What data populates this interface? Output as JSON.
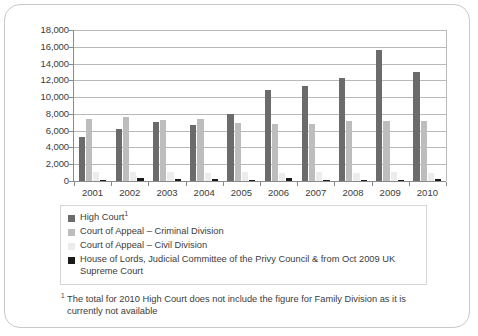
{
  "chart_data": {
    "type": "bar",
    "title": "",
    "subtitle": "",
    "xlabel": "",
    "ylabel": "",
    "ylim": [
      0,
      18000
    ],
    "ytick_step": 2000,
    "ytick_labels": [
      "18,000",
      "16,000",
      "14,000",
      "12,000",
      "10,000",
      "8,000",
      "6,000",
      "4,000",
      "2,000",
      "0"
    ],
    "grid": true,
    "legend_position": "below-chart",
    "categories": [
      "2001",
      "2002",
      "2003",
      "2004",
      "2005",
      "2006",
      "2007",
      "2008",
      "2009",
      "2010"
    ],
    "series": [
      {
        "name": "High Court",
        "color": "#6b6b6b",
        "values": [
          5300,
          6150,
          7000,
          6700,
          7950,
          10850,
          11350,
          12300,
          15650,
          12950
        ]
      },
      {
        "name": "Court of Appeal – Criminal Division",
        "color": "#bdbdbd",
        "values": [
          7350,
          7650,
          7300,
          7450,
          6900,
          6800,
          6800,
          7100,
          7100,
          7150
        ]
      },
      {
        "name": "Court of Appeal – Civil Division",
        "color": "#ececec",
        "values": [
          1050,
          1100,
          1100,
          1000,
          1100,
          950,
          1050,
          950,
          1100,
          1000
        ]
      },
      {
        "name": "House of Lords, Judicial Committee of the Privy Council & from Oct 2009 UK Supreme Court",
        "color": "#1a1a1a",
        "values": [
          150,
          330,
          200,
          210,
          180,
          300,
          170,
          120,
          170,
          250
        ]
      }
    ]
  },
  "legend": {
    "items": [
      {
        "label": "High Court",
        "superscript": "1",
        "color": "#6b6b6b",
        "swatch_name": "legend-swatch-high-court"
      },
      {
        "label": "Court of Appeal – Criminal Division",
        "superscript": "",
        "color": "#bdbdbd",
        "swatch_name": "legend-swatch-coa-criminal"
      },
      {
        "label": "Court of Appeal – Civil Division",
        "superscript": "",
        "color": "#ececec",
        "swatch_name": "legend-swatch-coa-civil"
      },
      {
        "label": "House of Lords, Judicial  Committee of the Privy Council & from Oct 2009 UK Supreme Court",
        "superscript": "",
        "color": "#1a1a1a",
        "swatch_name": "legend-swatch-house-of-lords"
      }
    ]
  },
  "footnote": {
    "marker": "1",
    "text": "The total for 2010 High Court does not include the figure for Family Division as it is currently not available"
  },
  "colors": {
    "axis": "#8a8a8a",
    "gridline": "#b9b9b9",
    "border": "#c9c9c9",
    "text": "#3c3c3c"
  }
}
